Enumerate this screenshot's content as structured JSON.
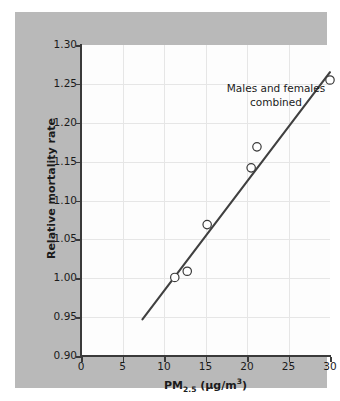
{
  "figure": {
    "panel_color": "#b9b9b9",
    "plot_background": "#fdfdfd",
    "grid_color": "#e6e6e6",
    "axis_color": "#3a3a3a",
    "line_color": "#404040",
    "marker_edge_color": "#3a3a3a",
    "marker_face_color": "#ffffff"
  },
  "chart_data": {
    "type": "scatter",
    "title": "",
    "annotation": {
      "line1": "Males and females",
      "line2": "combined"
    },
    "xlabel_text": "PM2.5 (µg/m3)",
    "xlabel_parts": {
      "prefix": "PM",
      "subscript": "2.5",
      "unit_open": " (",
      "unit_mu": "µg/m",
      "unit_exponent": "3",
      "unit_close": ")"
    },
    "ylabel": "Relative mortality rate",
    "xlim": [
      0,
      30
    ],
    "ylim": [
      0.9,
      1.3
    ],
    "xticks": [
      0,
      5,
      10,
      15,
      20,
      25,
      30
    ],
    "xtick_labels": [
      "0",
      "5",
      "10",
      "15",
      "20",
      "25",
      "30"
    ],
    "yticks": [
      0.9,
      0.95,
      1.0,
      1.05,
      1.1,
      1.15,
      1.2,
      1.25,
      1.3
    ],
    "ytick_labels": [
      "0.90",
      "0.95",
      "1.00",
      "1.05",
      "1.10",
      "1.15",
      "1.20",
      "1.25",
      "1.30"
    ],
    "grid": true,
    "legend": null,
    "points": [
      {
        "x": 11.3,
        "y": 1.001
      },
      {
        "x": 12.8,
        "y": 1.009
      },
      {
        "x": 15.2,
        "y": 1.069
      },
      {
        "x": 20.5,
        "y": 1.142
      },
      {
        "x": 21.2,
        "y": 1.169
      },
      {
        "x": 30.0,
        "y": 1.255
      }
    ],
    "fit_line": {
      "x_start": 7.4,
      "y_start": 0.947,
      "x_end": 30.0,
      "y_end": 1.265
    }
  }
}
